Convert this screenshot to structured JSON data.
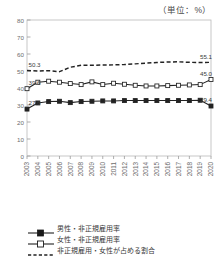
{
  "unit_note": "（単位：%）",
  "chart_data": {
    "type": "line",
    "title": "",
    "subtitle": "",
    "xlabel": "",
    "ylabel": "",
    "unit": "%",
    "ylim": [
      0,
      80
    ],
    "ytick_step": 10,
    "yticks": [
      "0",
      "10",
      "20",
      "30",
      "40",
      "50",
      "60",
      "70",
      "80"
    ],
    "grid": false,
    "legend_position": "bottom",
    "categories": [
      "2003",
      "2004",
      "2005",
      "2006",
      "2007",
      "2008",
      "2009",
      "2010",
      "2011",
      "2012",
      "2013",
      "2014",
      "2015",
      "2016",
      "2017",
      "2018",
      "2019",
      "2020"
    ],
    "series": [
      {
        "name": "男性・非正規雇用率",
        "marker": "filled-square",
        "line": "solid",
        "color": "#222222",
        "values": [
          27.6,
          31.2,
          32.0,
          32.2,
          31.4,
          32.0,
          32.2,
          32.4,
          32.4,
          32.6,
          32.6,
          32.6,
          32.6,
          32.6,
          32.6,
          32.6,
          32.8,
          29.4
        ],
        "start_label": "27.6",
        "end_label": "29.4"
      },
      {
        "name": "女性・非正規雇用率",
        "marker": "open-square",
        "line": "solid",
        "color": "#222222",
        "values": [
          39.6,
          43.4,
          44.0,
          43.4,
          42.6,
          42.0,
          43.6,
          42.0,
          42.8,
          42.2,
          41.6,
          41.2,
          41.2,
          41.4,
          41.6,
          41.8,
          42.0,
          45.0
        ],
        "start_label": "39.6",
        "end_label": "45.0"
      },
      {
        "name": "非正規雇用・女性が占める割合",
        "marker": "none",
        "line": "dashed",
        "color": "#222222",
        "values": [
          50.3,
          50.0,
          50.2,
          49.6,
          52.2,
          53.4,
          53.4,
          53.5,
          53.6,
          53.8,
          54.2,
          54.6,
          55.0,
          55.3,
          55.4,
          55.1,
          55.0,
          55.1
        ],
        "start_label": "50.3",
        "end_label": "55.1"
      }
    ]
  },
  "legend": {
    "items": [
      {
        "label": "男性・非正規雇用率",
        "key": "line-filled-square"
      },
      {
        "label": "女性・非正規雇用率",
        "key": "line-open-square"
      },
      {
        "label": "非正規雇用・女性が占める割合",
        "key": "line-dashed"
      }
    ]
  }
}
